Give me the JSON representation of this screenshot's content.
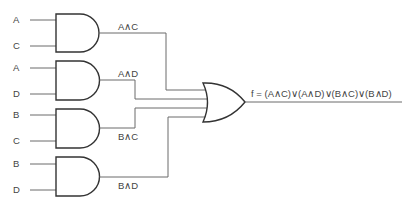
{
  "diagram": {
    "type": "logic-circuit",
    "inputs": [
      {
        "gate": 1,
        "top": "A",
        "bottom": "C"
      },
      {
        "gate": 2,
        "top": "A",
        "bottom": "D"
      },
      {
        "gate": 3,
        "top": "B",
        "bottom": "C"
      },
      {
        "gate": 4,
        "top": "B",
        "bottom": "D"
      }
    ],
    "and_outputs": [
      "A∧C",
      "A∧D",
      "B∧C",
      "B∧D"
    ],
    "or_gate": {
      "inputs": 4
    },
    "output_expression": "f = (A∧C)∨(A∧D)∨(B∧C)∨(B∧D)",
    "colors": {
      "wire": "#6a6a6a",
      "gate_stroke": "#333333",
      "text": "#444444",
      "background": "#ffffff"
    }
  }
}
